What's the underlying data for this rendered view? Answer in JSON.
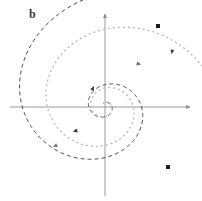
{
  "figure": {
    "panel_label": "b",
    "background_color": "#ffffff",
    "width": 202,
    "height": 201
  },
  "axes": {
    "origin": [
      105,
      107
    ],
    "x_axis": {
      "name": "horizontal-axis",
      "from": [
        10,
        107
      ],
      "to": [
        192,
        107
      ],
      "color": "#9a9a9a",
      "arrow_end": "right"
    },
    "y_axis": {
      "name": "vertical-axis",
      "from": [
        105,
        196
      ],
      "to": [
        105,
        12
      ],
      "color": "#9a9a9a",
      "arrow_end": "top"
    }
  },
  "chart_data": {
    "type": "line",
    "title": "",
    "xlabel": "",
    "ylabel": "",
    "grid": false,
    "legend": null,
    "series": [
      {
        "name": "dashed-spiral",
        "style": "dashed",
        "color": "#4a4a4a",
        "dasharray": "4,3",
        "start_point": [
          158,
          26
        ],
        "end_point": [
          105,
          107
        ],
        "direction": "inward-clockwise",
        "spiral": {
          "a": 4.2,
          "b": 0.26,
          "theta_start": 1.12,
          "theta_end": 14.6,
          "x_scale": 1.0,
          "y_scale": 0.92
        },
        "marker": {
          "shape": "square",
          "x": 158,
          "y": 26,
          "size": 4
        },
        "arrows": [
          {
            "t": 0.12,
            "x": 172,
            "y": 52
          },
          {
            "t": 0.5,
            "x": 75,
            "y": 131
          },
          {
            "t": 0.8,
            "x": 93,
            "y": 88
          }
        ]
      },
      {
        "name": "dotted-spiral",
        "style": "dotted",
        "color": "#bdbdbd",
        "dasharray": "1,4",
        "start_point": [
          168,
          167
        ],
        "end_point": [
          105,
          107
        ],
        "direction": "inward-clockwise",
        "spiral": {
          "a": 5.0,
          "b": 0.225,
          "theta_start": 0.05,
          "theta_end": 14.0,
          "x_scale": 1.0,
          "y_scale": 0.95
        },
        "marker": {
          "shape": "square",
          "x": 168,
          "y": 167,
          "size": 4
        },
        "arrows": [
          {
            "t": 0.3,
            "x": 139,
            "y": 64
          },
          {
            "t": 0.58,
            "x": 55,
            "y": 146
          }
        ]
      }
    ]
  },
  "markers": {
    "dashed_start": {
      "name": "dashed-start-marker",
      "x": 158,
      "y": 26
    },
    "dotted_start": {
      "name": "dotted-start-marker",
      "x": 168,
      "y": 167
    }
  }
}
